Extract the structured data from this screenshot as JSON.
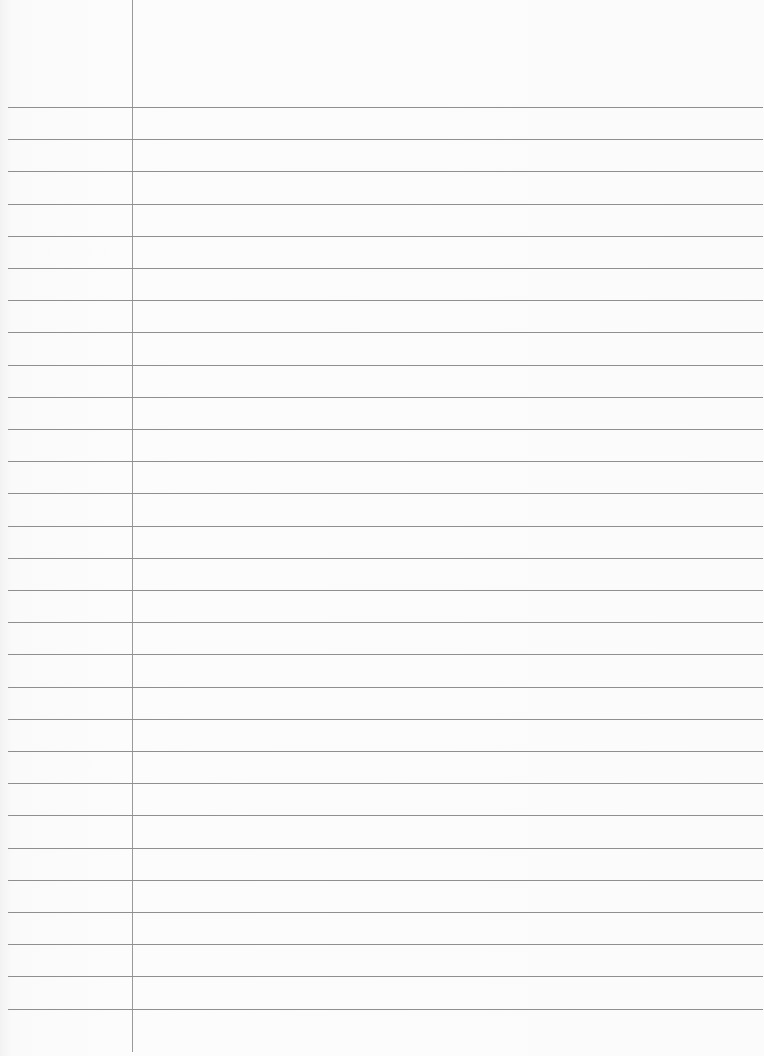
{
  "paper": {
    "type": "lined-notebook-page",
    "margin_line_x": 132,
    "first_rule_y": 107,
    "rule_spacing": 32.2,
    "rule_count": 29,
    "rule_color": "#8f8f8f",
    "margin_color": "#9a9a9a",
    "background": "#fbfbfb"
  }
}
